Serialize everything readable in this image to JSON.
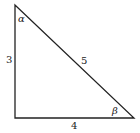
{
  "diagram": {
    "type": "right-triangle",
    "stroke_color": "#222222",
    "vertices": {
      "top": [
        15,
        5
      ],
      "right_angle": [
        15,
        118
      ],
      "bottom_right": [
        134,
        118
      ]
    },
    "sides": {
      "vertical": "3",
      "hypotenuse": "5",
      "horizontal": "4"
    },
    "angles": {
      "top": "α",
      "bottom_right": "β"
    }
  }
}
